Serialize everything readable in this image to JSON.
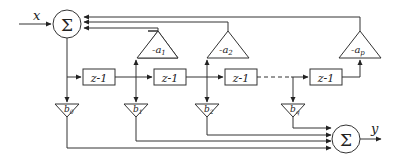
{
  "diagram": {
    "title": "",
    "type": "IIR filter direct form block diagram",
    "input_label": "x",
    "output_label": "y",
    "sum_symbol": "Σ",
    "delay_label": "z-1",
    "feedback_gains": [
      "-a1",
      "-a2",
      "-ap"
    ],
    "feedback_gain_parts": [
      {
        "base": "-a",
        "sub": "1"
      },
      {
        "base": "-a",
        "sub": "2"
      },
      {
        "base": "-a",
        "sub": "p"
      }
    ],
    "feedforward_gains": [
      {
        "base": "b",
        "sub": "0"
      },
      {
        "base": "b",
        "sub": "1"
      },
      {
        "base": "b",
        "sub": "2"
      },
      {
        "base": "b",
        "sub": "q"
      }
    ],
    "delays": [
      "z-1",
      "z-1",
      "z-1",
      "z-1"
    ],
    "colors": {
      "line": "#333333",
      "background": "#ffffff"
    }
  }
}
